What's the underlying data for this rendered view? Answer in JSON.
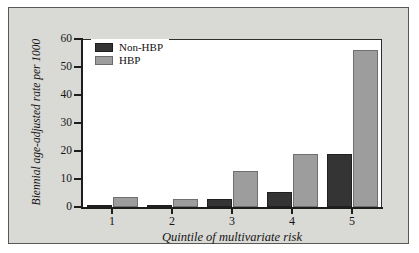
{
  "chart_data": {
    "type": "bar",
    "title": "",
    "xlabel": "Quintile of multivariate risk",
    "ylabel": "Biennial age-adjusted rate per 1000",
    "categories": [
      "1",
      "2",
      "3",
      "4",
      "5"
    ],
    "series": [
      {
        "name": "Non-HBP",
        "color": "#343434",
        "values": [
          0.4,
          0.8,
          3,
          5.5,
          19
        ]
      },
      {
        "name": "HBP",
        "color": "#9d9d9d",
        "values": [
          3.5,
          3,
          13,
          19,
          56
        ]
      }
    ],
    "ylim": [
      0,
      60
    ],
    "yticks": [
      "0",
      "10",
      "20",
      "30",
      "40",
      "50",
      "60"
    ],
    "ytick_values": [
      0,
      10,
      20,
      30,
      40,
      50,
      60
    ],
    "grid": false,
    "legend_position": "top-left"
  },
  "legend": {
    "items": [
      {
        "label": "Non-HBP"
      },
      {
        "label": "HBP"
      }
    ]
  },
  "colors": {
    "non_hbp": "#343434",
    "hbp": "#9d9d9d",
    "panel_background": "#d9d9d5",
    "plot_background": "#ffffff",
    "axis": "#1d1d1d"
  }
}
